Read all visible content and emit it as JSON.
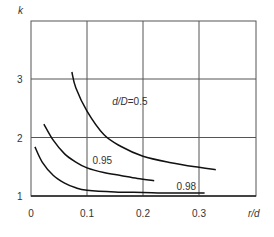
{
  "chart_data": {
    "type": "line",
    "title": "",
    "xlabel": "r/d",
    "ylabel": "k",
    "xlim": [
      0,
      0.4
    ],
    "ylim": [
      1,
      4
    ],
    "x_ticks": [
      "0",
      "0.1",
      "0.2",
      "0.3"
    ],
    "y_ticks": [
      "1",
      "2",
      "3"
    ],
    "grid": true,
    "legend_position": "inline labels",
    "series": [
      {
        "name": "d/D=0.5",
        "label": "d/D=0.5",
        "x": [
          0.073,
          0.08,
          0.1,
          0.13,
          0.16,
          0.2,
          0.25,
          0.3,
          0.33
        ],
        "y": [
          3.12,
          2.85,
          2.45,
          2.05,
          1.85,
          1.68,
          1.57,
          1.49,
          1.45
        ]
      },
      {
        "name": "0.95",
        "label": "0.95",
        "x": [
          0.023,
          0.04,
          0.06,
          0.08,
          0.1,
          0.13,
          0.16,
          0.19,
          0.22
        ],
        "y": [
          2.23,
          1.95,
          1.72,
          1.58,
          1.48,
          1.4,
          1.35,
          1.3,
          1.26
        ]
      },
      {
        "name": "0.98",
        "label": "0.98",
        "x": [
          0.007,
          0.02,
          0.04,
          0.06,
          0.08,
          0.1,
          0.15,
          0.2,
          0.25,
          0.31
        ],
        "y": [
          1.84,
          1.58,
          1.35,
          1.22,
          1.14,
          1.1,
          1.07,
          1.06,
          1.05,
          1.05
        ]
      }
    ],
    "annotations": [
      {
        "text": "d/D=0.5",
        "x": 0.145,
        "y": 2.55
      },
      {
        "text": "0.95",
        "x": 0.11,
        "y": 1.55
      },
      {
        "text": "0.98",
        "x": 0.26,
        "y": 1.1
      }
    ]
  }
}
